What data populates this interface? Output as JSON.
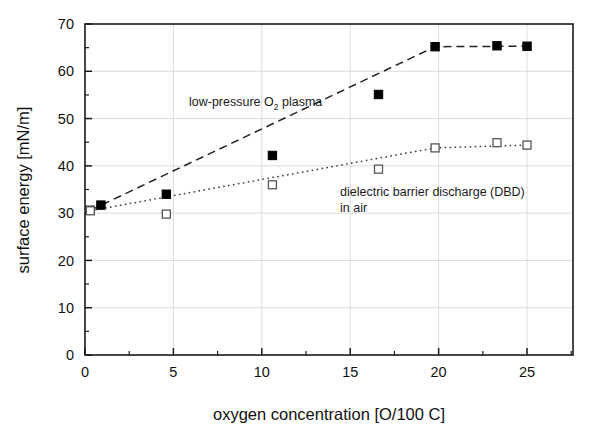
{
  "chart_data": {
    "type": "scatter",
    "title": "",
    "xlabel": "oxygen concentration [O/100 C]",
    "ylabel": "surface energy [mN/m]",
    "xlim": [
      0,
      27.6
    ],
    "ylim": [
      0,
      70
    ],
    "xticks": [
      0,
      5,
      10,
      15,
      20,
      25
    ],
    "xtick_labels": [
      "0",
      "5",
      "10",
      "15",
      "20",
      "25"
    ],
    "yticks": [
      0,
      10,
      20,
      30,
      40,
      50,
      60,
      70
    ],
    "ytick_labels": [
      "0",
      "10",
      "20",
      "30",
      "40",
      "50",
      "60",
      "70"
    ],
    "x_minor_tick_interval": 2.5,
    "y_minor_tick_interval": 5,
    "grid": true,
    "grid_color": "#d6d6d6",
    "frame": true,
    "frame_color": "#1a1a1a",
    "legend": "none",
    "series": [
      {
        "name": "low-pressure O2 plasma",
        "marker": "filled-square",
        "marker_color": "#000000",
        "line_style": "dashed",
        "line_color": "#222222",
        "points": [
          {
            "x": 0.3,
            "y": 30.6
          },
          {
            "x": 0.9,
            "y": 31.7
          },
          {
            "x": 4.6,
            "y": 34.0
          },
          {
            "x": 10.6,
            "y": 42.2
          },
          {
            "x": 16.6,
            "y": 55.1
          },
          {
            "x": 19.8,
            "y": 65.2
          },
          {
            "x": 23.3,
            "y": 65.4
          },
          {
            "x": 25.0,
            "y": 65.3
          }
        ],
        "trend": [
          {
            "x": 0.3,
            "y": 30.6
          },
          {
            "x": 19.8,
            "y": 65.2
          },
          {
            "x": 25.0,
            "y": 65.3
          }
        ]
      },
      {
        "name": "dielectric barrier discharge (DBD) in air",
        "marker": "open-square",
        "marker_color": "#000000",
        "line_style": "dotted",
        "line_color": "#3a3a3a",
        "points": [
          {
            "x": 0.3,
            "y": 30.5
          },
          {
            "x": 4.6,
            "y": 29.8
          },
          {
            "x": 10.6,
            "y": 36.0
          },
          {
            "x": 16.6,
            "y": 39.3
          },
          {
            "x": 19.8,
            "y": 43.8
          },
          {
            "x": 23.3,
            "y": 44.9
          },
          {
            "x": 25.0,
            "y": 44.4
          }
        ],
        "trend": [
          {
            "x": 0.3,
            "y": 30.5
          },
          {
            "x": 19.8,
            "y": 43.8
          },
          {
            "x": 25.0,
            "y": 44.4
          }
        ]
      }
    ],
    "annotations": [
      {
        "id": "plasma",
        "text_main": "low-pressure O",
        "text_sub": "2",
        "text_tail": " plasma",
        "x": 10.6,
        "y": 49.8
      },
      {
        "id": "dbd",
        "line1": "dielectric barrier discharge (DBD)",
        "line2": "in air",
        "x": 14.0,
        "y": 35.0
      }
    ]
  }
}
